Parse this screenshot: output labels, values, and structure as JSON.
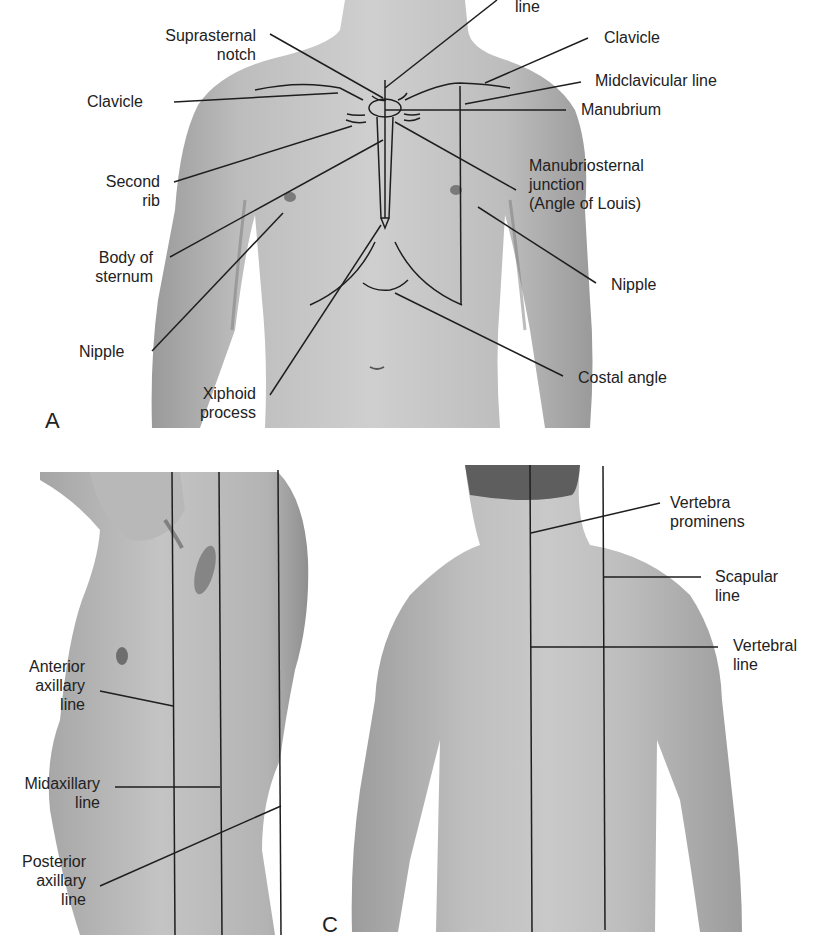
{
  "figure": {
    "panels": [
      {
        "id": "A",
        "letter": "A",
        "view": "anterior-chest",
        "labels": {
          "top_line_partial": "line",
          "suprasternal_notch_1": "Suprasternal",
          "suprasternal_notch_2": "notch",
          "clavicle_left": "Clavicle",
          "clavicle_right": "Clavicle",
          "midclavicular_line": "Midclavicular line",
          "manubrium": "Manubrium",
          "second_rib_1": "Second",
          "second_rib_2": "rib",
          "manubriosternal_1": "Manubriosternal",
          "manubriosternal_2": "junction",
          "manubriosternal_3": "(Angle of Louis)",
          "body_of_sternum_1": "Body of",
          "body_of_sternum_2": "sternum",
          "nipple_left": "Nipple",
          "nipple_right": "Nipple",
          "costal_angle": "Costal angle",
          "xiphoid_1": "Xiphoid",
          "xiphoid_2": "process"
        }
      },
      {
        "id": "B",
        "letter": "",
        "view": "lateral-chest",
        "labels": {
          "anterior_axillary_1": "Anterior",
          "anterior_axillary_2": "axillary",
          "anterior_axillary_3": "line",
          "midaxillary_1": "Midaxillary",
          "midaxillary_2": "line",
          "posterior_axillary_1": "Posterior",
          "posterior_axillary_2": "axillary",
          "posterior_axillary_3": "line"
        }
      },
      {
        "id": "C",
        "letter": "C",
        "view": "posterior-chest",
        "labels": {
          "vertebra_prominens_1": "Vertebra",
          "vertebra_prominens_2": "prominens",
          "scapular_line_1": "Scapular",
          "scapular_line_2": "line",
          "vertebral_line_1": "Vertebral",
          "vertebral_line_2": "line"
        }
      }
    ],
    "colors": {
      "background": "#ffffff",
      "skin_light": "#c9c9c9",
      "skin_mid": "#a9a9a9",
      "skin_dark": "#8a8a8a",
      "line": "#1e1e1e",
      "text": "#222222"
    }
  }
}
